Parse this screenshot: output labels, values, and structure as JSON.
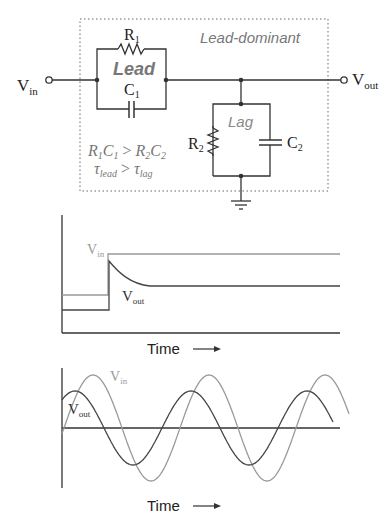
{
  "circuit": {
    "vin_label": "V",
    "vin_sub": "in",
    "vout_label": "V",
    "vout_sub": "out",
    "box_title": "Lead-dominant",
    "lead_label": "Lead",
    "lag_label": "Lag",
    "r1_label": "R",
    "r1_sub": "1",
    "c1_label": "C",
    "c1_sub": "1",
    "r2_label": "R",
    "r2_sub": "2",
    "c2_label": "C",
    "c2_sub": "2",
    "eq1": {
      "r1": "R",
      "s1": "1",
      "c1": "C",
      "s2": "1",
      "op": " > ",
      "r2": "R",
      "s3": "2",
      "c2": "C",
      "s4": "2"
    },
    "eq2": {
      "tau1": "τ",
      "lead": "lead",
      "op": " > ",
      "tau2": "τ",
      "lag": "lag"
    }
  },
  "step_plot": {
    "vin_label": "V",
    "vin_sub": "in",
    "vout_label": "V",
    "vout_sub": "out",
    "xlabel": "Time"
  },
  "sine_plot": {
    "vin_label": "V",
    "vin_sub": "in",
    "vout_label": "V",
    "vout_sub": "out",
    "xlabel": "Time"
  },
  "colors": {
    "wire": "#333333",
    "vin_trace": "#999999",
    "vout_trace": "#444444",
    "label_gray": "#777777",
    "box_dots": "#666666"
  },
  "chart_data": [
    {
      "type": "line",
      "title": "Step response",
      "xlabel": "Time",
      "ylabel": "",
      "series": [
        {
          "name": "Vin",
          "description": "step from low level up to high level, held constant"
        },
        {
          "name": "Vout",
          "description": "jumps with Vin then decays exponentially to intermediate level above initial"
        }
      ]
    },
    {
      "type": "line",
      "title": "Sinusoidal response",
      "xlabel": "Time",
      "ylabel": "",
      "series": [
        {
          "name": "Vin",
          "amplitude": 1.0,
          "phase": "reference"
        },
        {
          "name": "Vout",
          "amplitude": 0.68,
          "phase": "leads Vin"
        }
      ]
    }
  ]
}
